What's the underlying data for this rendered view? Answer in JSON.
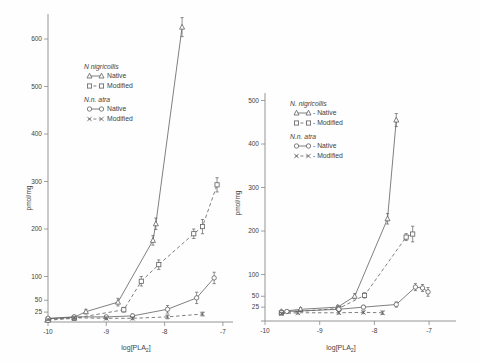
{
  "figure": {
    "background": "#fefefe",
    "ink_color": "#3f3f3f",
    "line_color": "#5f5f5f"
  },
  "chart_data": [
    {
      "type": "line",
      "panel": "left",
      "xlabel": {
        "pre": "log[PLA",
        "sub": "2",
        "post": "]"
      },
      "ylabel": "pmol/mg",
      "xlim": [
        -10,
        -7
      ],
      "ylim": [
        0,
        650
      ],
      "x_ticks": [
        "-10",
        "-9",
        "-8",
        "-7"
      ],
      "x_tick_values": [
        -10,
        -9,
        -8,
        -7
      ],
      "y_ticks": [
        "25",
        "50",
        "100",
        "200",
        "300",
        "400",
        "500",
        "600"
      ],
      "y_tick_values": [
        25,
        50,
        100,
        200,
        300,
        400,
        500,
        600
      ],
      "legend": {
        "groups": [
          {
            "species": "N nigricollis",
            "entries": [
              {
                "marker": "triangle",
                "line": "solid",
                "label": "Native"
              },
              {
                "marker": "square",
                "line": "dashed",
                "label": "Modified"
              }
            ]
          },
          {
            "species": "N.n. atra",
            "entries": [
              {
                "marker": "circle",
                "line": "solid",
                "label": "Native"
              },
              {
                "marker": "x",
                "line": "dashed",
                "label": "Modified"
              }
            ]
          }
        ]
      },
      "series": [
        {
          "name": "N. nigricollis Native",
          "marker": "triangle",
          "line": "solid",
          "points": [
            {
              "x": -10,
              "y": 11,
              "err": 0
            },
            {
              "x": -9.55,
              "y": 14,
              "err": 3
            },
            {
              "x": -9.35,
              "y": 26,
              "err": 5
            },
            {
              "x": -8.8,
              "y": 46,
              "err": 8
            },
            {
              "x": -8.2,
              "y": 176,
              "err": 10
            },
            {
              "x": -8.15,
              "y": 211,
              "err": 12
            },
            {
              "x": -7.7,
              "y": 625,
              "err": 20
            }
          ]
        },
        {
          "name": "N. nigricollis Modified",
          "marker": "square",
          "line": "dashed",
          "points": [
            {
              "x": -10,
              "y": 8,
              "err": 0
            },
            {
              "x": -9.55,
              "y": 12,
              "err": 3
            },
            {
              "x": -8.7,
              "y": 30,
              "err": 5
            },
            {
              "x": -8.4,
              "y": 90,
              "err": 10
            },
            {
              "x": -8.1,
              "y": 125,
              "err": 10
            },
            {
              "x": -7.5,
              "y": 190,
              "err": 10
            },
            {
              "x": -7.35,
              "y": 205,
              "err": 15
            },
            {
              "x": -7.1,
              "y": 293,
              "err": 15
            }
          ]
        },
        {
          "name": "N. n. atra Native",
          "marker": "circle",
          "line": "solid",
          "points": [
            {
              "x": -10,
              "y": 12,
              "err": 0
            },
            {
              "x": -9.55,
              "y": 15,
              "err": 3
            },
            {
              "x": -9.0,
              "y": 15,
              "err": 3
            },
            {
              "x": -8.55,
              "y": 17,
              "err": 4
            },
            {
              "x": -7.95,
              "y": 31,
              "err": 8
            },
            {
              "x": -7.45,
              "y": 55,
              "err": 12
            },
            {
              "x": -7.15,
              "y": 97,
              "err": 12
            }
          ]
        },
        {
          "name": "N. n. atra Modified",
          "marker": "x",
          "line": "dashed",
          "points": [
            {
              "x": -10,
              "y": 10,
              "err": 0
            },
            {
              "x": -9.55,
              "y": 13,
              "err": 3
            },
            {
              "x": -9.0,
              "y": 12,
              "err": 3
            },
            {
              "x": -8.55,
              "y": 12,
              "err": 3
            },
            {
              "x": -7.95,
              "y": 15,
              "err": 4
            },
            {
              "x": -7.35,
              "y": 21,
              "err": 4
            }
          ]
        }
      ]
    },
    {
      "type": "line",
      "panel": "right",
      "xlabel": {
        "pre": "log[PLA",
        "sub": "2",
        "post": "]"
      },
      "ylabel": "pmol/mg",
      "xlim": [
        -10,
        -7
      ],
      "ylim": [
        0,
        500
      ],
      "x_ticks": [
        "-10",
        "-9",
        "-8",
        "-7"
      ],
      "x_tick_values": [
        -10,
        -9,
        -8,
        -7
      ],
      "y_ticks": [
        "25",
        "50",
        "100",
        "200",
        "300",
        "400",
        "500"
      ],
      "y_tick_values": [
        25,
        50,
        100,
        200,
        300,
        400,
        500
      ],
      "legend": {
        "groups": [
          {
            "species": "N. nigricollis",
            "entries": [
              {
                "marker": "triangle",
                "line": "solid",
                "label": "- Native"
              },
              {
                "marker": "square",
                "line": "dashed",
                "label": "- Modified"
              }
            ]
          },
          {
            "species": "N.n. atra",
            "entries": [
              {
                "marker": "circle",
                "line": "solid",
                "label": "- Native"
              },
              {
                "marker": "x",
                "line": "dashed",
                "label": "- Modified"
              }
            ]
          }
        ]
      },
      "series": [
        {
          "name": "N. nigricollis Native",
          "marker": "triangle",
          "line": "solid",
          "points": [
            {
              "x": -9.7,
              "y": 15,
              "err": 3
            },
            {
              "x": -9.35,
              "y": 20,
              "err": 4
            },
            {
              "x": -8.67,
              "y": 25,
              "err": 4
            },
            {
              "x": -8.36,
              "y": 50,
              "err": 6
            },
            {
              "x": -7.76,
              "y": 228,
              "err": 12
            },
            {
              "x": -7.6,
              "y": 455,
              "err": 15
            }
          ]
        },
        {
          "name": "N. nigricollis Modified",
          "marker": "square",
          "line": "dashed",
          "points": [
            {
              "x": -9.7,
              "y": 12,
              "err": 3
            },
            {
              "x": -8.65,
              "y": 22,
              "err": 4
            },
            {
              "x": -8.18,
              "y": 52,
              "err": 6
            },
            {
              "x": -7.42,
              "y": 186,
              "err": 8
            },
            {
              "x": -7.3,
              "y": 193,
              "err": 18
            }
          ]
        },
        {
          "name": "N. n. atra Native",
          "marker": "circle",
          "line": "solid",
          "points": [
            {
              "x": -9.6,
              "y": 15,
              "err": 3
            },
            {
              "x": -8.65,
              "y": 20,
              "err": 3
            },
            {
              "x": -8.2,
              "y": 25,
              "err": 4
            },
            {
              "x": -7.6,
              "y": 31,
              "err": 6
            },
            {
              "x": -7.25,
              "y": 71,
              "err": 8
            },
            {
              "x": -7.12,
              "y": 69,
              "err": 8
            },
            {
              "x": -7.02,
              "y": 60,
              "err": 10
            }
          ]
        },
        {
          "name": "N. n. atra Modified",
          "marker": "x",
          "line": "dashed",
          "points": [
            {
              "x": -9.7,
              "y": 10,
              "err": 3
            },
            {
              "x": -9.4,
              "y": 12,
              "err": 3
            },
            {
              "x": -8.65,
              "y": 12,
              "err": 3
            },
            {
              "x": -8.2,
              "y": 13,
              "err": 3
            },
            {
              "x": -7.85,
              "y": 12,
              "err": 4
            }
          ]
        }
      ]
    }
  ]
}
